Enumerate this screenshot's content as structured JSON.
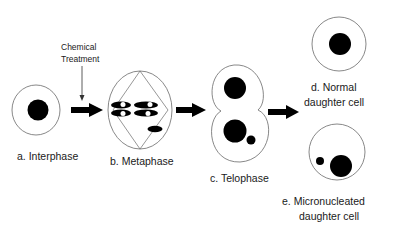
{
  "diagram": {
    "stages": [
      {
        "id": "a",
        "label": "a. Interphase"
      },
      {
        "id": "b",
        "label": "b. Metaphase"
      },
      {
        "id": "c",
        "label": "c. Telophase"
      },
      {
        "id": "d",
        "label_line1": "d. Normal",
        "label_line2": "daughter cell"
      },
      {
        "id": "e",
        "label_line1": "e. Micronucleated",
        "label_line2": "daughter cell"
      }
    ],
    "annotation": {
      "line1": "Chemical",
      "line2": "Treatment"
    },
    "colors": {
      "outline": "#6a6a6a",
      "nucleus": "#000000",
      "background": "#ffffff"
    }
  }
}
